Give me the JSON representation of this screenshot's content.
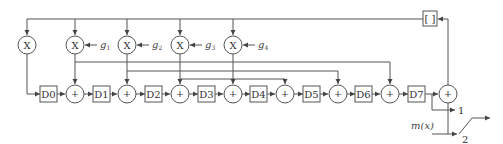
{
  "diagram": {
    "type": "block-diagram",
    "delays": [
      "D0",
      "D1",
      "D2",
      "D3",
      "D4",
      "D5",
      "D6",
      "D7"
    ],
    "multiplier_symbol": "X",
    "adder_symbol": "+",
    "gains": [
      {
        "label": "g",
        "sub": "1"
      },
      {
        "label": "g",
        "sub": "2"
      },
      {
        "label": "g",
        "sub": "3"
      },
      {
        "label": "g",
        "sub": "4"
      }
    ],
    "feedback_block": "[ ]",
    "input_label": "m(x)",
    "switch_positions": [
      "1",
      "2"
    ]
  }
}
